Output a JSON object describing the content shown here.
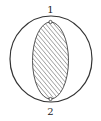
{
  "diagram": {
    "labels": {
      "top": "1",
      "bottom": "2"
    },
    "outer_circle": {
      "cx": 51,
      "cy": 59,
      "rx": 41,
      "ry": 43
    },
    "inner_ellipse": {
      "cx": 50.5,
      "cy": 60.5,
      "rx": 18,
      "ry": 38.5,
      "fill": "hatched"
    },
    "nodes": [
      {
        "id": "1",
        "cx": 50.5,
        "cy": 22
      },
      {
        "id": "2",
        "cx": 50.5,
        "cy": 99
      }
    ],
    "colors": {
      "stroke": "#333333",
      "hatch": "#555555",
      "background": "#ffffff"
    }
  }
}
